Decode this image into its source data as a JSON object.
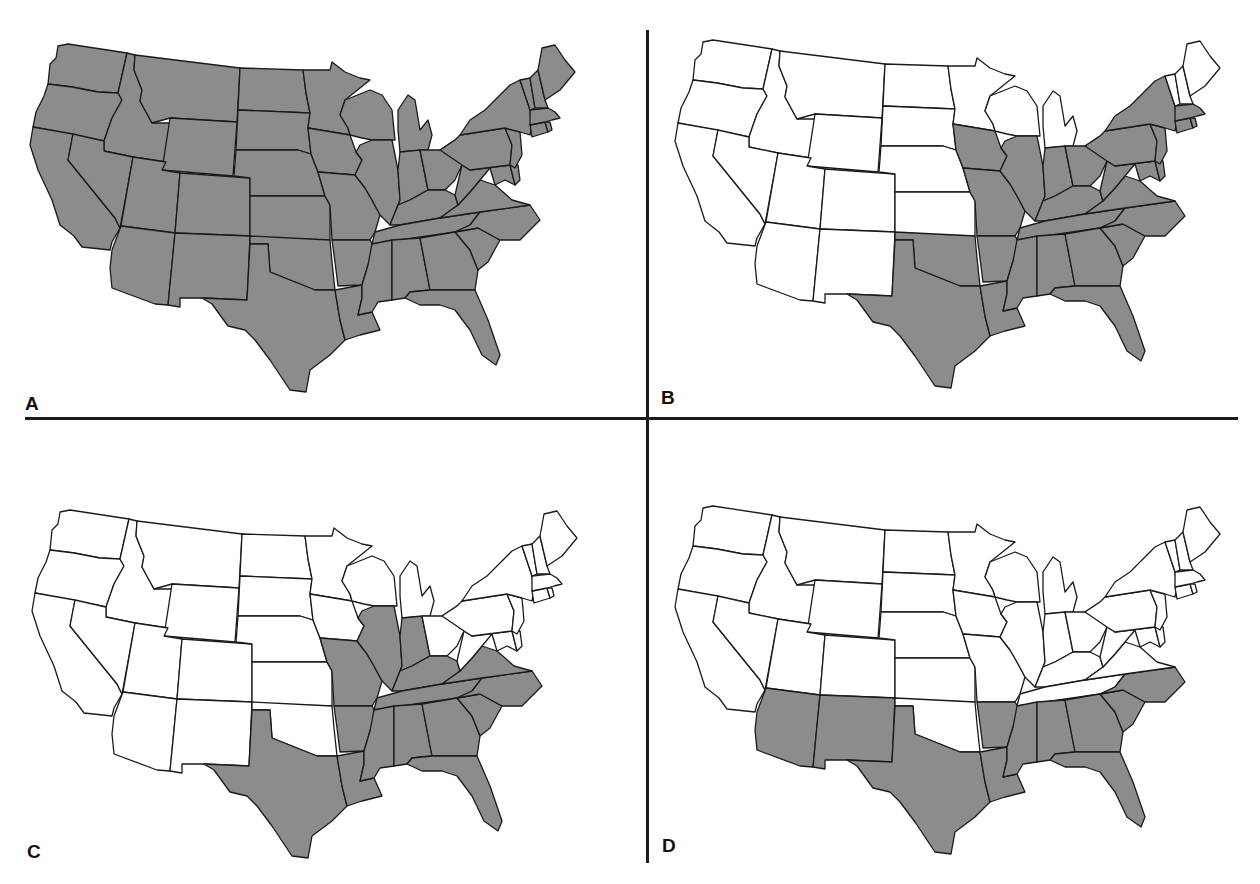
{
  "figure": {
    "fill_shaded": "#8c8c8c",
    "fill_unshaded": "#ffffff",
    "outline_color": "#1a1a1a"
  },
  "panels": [
    {
      "label": "A",
      "shaded_states": [
        "WA",
        "OR",
        "CA",
        "ID",
        "NV",
        "MT",
        "WY",
        "UT",
        "AZ",
        "CO",
        "NM",
        "ND",
        "SD",
        "NE",
        "KS",
        "OK",
        "TX",
        "MN",
        "IA",
        "MO",
        "AR",
        "LA",
        "WI",
        "IL",
        "MI",
        "IN",
        "OH",
        "KY",
        "TN",
        "MS",
        "AL",
        "GA",
        "FL",
        "SC",
        "NC",
        "VA",
        "WV",
        "MD",
        "DE",
        "PA",
        "NJ",
        "NY",
        "CT",
        "RI",
        "MA",
        "VT",
        "NH",
        "ME"
      ]
    },
    {
      "label": "B",
      "shaded_states": [
        "TX",
        "OK",
        "IA",
        "MO",
        "AR",
        "LA",
        "IL",
        "IN",
        "OH",
        "KY",
        "TN",
        "MS",
        "AL",
        "GA",
        "FL",
        "SC",
        "NC",
        "VA",
        "WV",
        "MD",
        "DE",
        "PA",
        "NJ",
        "NY",
        "CT",
        "RI",
        "MA"
      ]
    },
    {
      "label": "C",
      "shaded_states": [
        "TX",
        "MO",
        "AR",
        "LA",
        "IL",
        "IN",
        "KY",
        "TN",
        "MS",
        "AL",
        "GA",
        "FL",
        "SC",
        "NC",
        "VA"
      ]
    },
    {
      "label": "D",
      "shaded_states": [
        "AZ",
        "NM",
        "TX",
        "AR",
        "LA",
        "MS",
        "AL",
        "GA",
        "FL",
        "SC",
        "NC"
      ]
    }
  ]
}
